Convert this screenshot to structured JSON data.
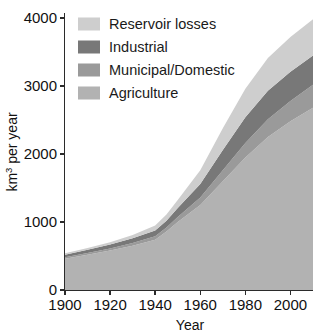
{
  "chart_data": {
    "type": "area",
    "title": "",
    "subtitle": "",
    "xlabel": "Year",
    "ylabel": "km3 per year",
    "ylabel_base": "km",
    "ylabel_sup": "3",
    "ylabel_tail": " per year",
    "xlim": [
      1900,
      2010
    ],
    "ylim": [
      0,
      4000
    ],
    "xticks": [
      1900,
      1920,
      1940,
      1960,
      1980,
      2000
    ],
    "xtick_labels": [
      "1900",
      "1920",
      "1940",
      "1960",
      "1980",
      "2000"
    ],
    "yticks": [
      0,
      1000,
      2000,
      3000,
      4000
    ],
    "ytick_labels": [
      "0",
      "1000",
      "2000",
      "3000",
      "4000"
    ],
    "grid": false,
    "stacked": true,
    "legend_position": "top-left",
    "x": [
      1900,
      1910,
      1920,
      1930,
      1940,
      1945,
      1950,
      1960,
      1970,
      1980,
      1990,
      2000,
      2010
    ],
    "series": [
      {
        "name": "Agriculture",
        "color": "#b2b2b2",
        "values": [
          460,
          520,
          580,
          650,
          740,
          860,
          1000,
          1250,
          1600,
          1950,
          2250,
          2480,
          2680
        ]
      },
      {
        "name": "Municipal/Domestic",
        "color": "#9a9a9a",
        "values": [
          20,
          25,
          30,
          40,
          50,
          60,
          75,
          110,
          160,
          210,
          260,
          300,
          340
        ]
      },
      {
        "name": "Industrial",
        "color": "#787878",
        "values": [
          40,
          48,
          58,
          70,
          85,
          100,
          130,
          200,
          300,
          380,
          420,
          430,
          430
        ]
      },
      {
        "name": "Reservoir losses",
        "color": "#cecece",
        "values": [
          20,
          25,
          35,
          50,
          75,
          90,
          120,
          200,
          320,
          420,
          480,
          510,
          530
        ]
      }
    ],
    "legend_entries": [
      {
        "label": "Reservoir losses",
        "color": "#cecece"
      },
      {
        "label": "Industrial",
        "color": "#787878"
      },
      {
        "label": "Municipal/Domestic",
        "color": "#9a9a9a"
      },
      {
        "label": "Agriculture",
        "color": "#b2b2b2"
      }
    ]
  }
}
